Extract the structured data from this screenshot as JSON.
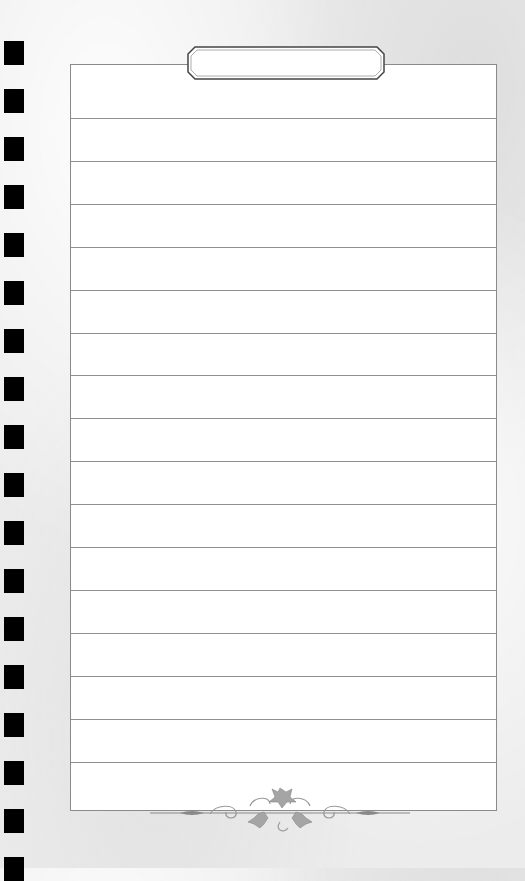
{
  "page": {
    "type": "lined-notepad-page",
    "title_tab_text": "",
    "line_count": 16,
    "binding_hole_count": 18
  },
  "colors": {
    "background": "#ececec",
    "paper": "#ffffff",
    "rule_line": "#8f8f8f",
    "border": "#8a8a8a",
    "binding_holes": "#000000",
    "ornament": "#9a9a9a"
  }
}
